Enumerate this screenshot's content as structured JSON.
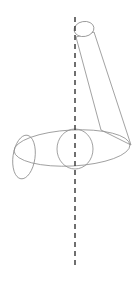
{
  "diagram": {
    "type": "line-drawing",
    "background": "#ffffff",
    "stroke_color": "#888888",
    "axis_color": "#333333",
    "shapes": {
      "axis": {
        "x": 75,
        "y1": 17,
        "y2": 265,
        "dash": "5,4"
      },
      "top_ellipse": {
        "cx": 84,
        "cy": 29,
        "rx": 10,
        "ry": 7.5
      },
      "tilted_rect": {
        "points": "76,37 94,32 131,145 101,130"
      },
      "big_ellipse": {
        "cx": 72,
        "cy": 148,
        "rx": 58,
        "ry": 18
      },
      "center_circle": {
        "cx": 75,
        "cy": 149,
        "rx": 18,
        "ry": 20
      },
      "left_ellipse": {
        "cx": 24,
        "cy": 155,
        "rx": 11,
        "ry": 22
      }
    }
  }
}
